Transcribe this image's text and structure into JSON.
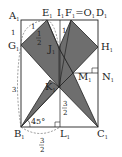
{
  "figure": {
    "type": "geometry",
    "fill_color": "#6e6e6e",
    "stroke_color": "#222222",
    "points": {
      "A": {
        "label": "A",
        "sub": "1"
      },
      "E": {
        "label": "E",
        "sub": "1"
      },
      "I": {
        "label": "I",
        "sub": "1"
      },
      "FO": {
        "label": "F",
        "sub": "1",
        "eq": "=O",
        "sub2": "1"
      },
      "D": {
        "label": "D",
        "sub": "1"
      },
      "G": {
        "label": "G",
        "sub": "1"
      },
      "H": {
        "label": "H",
        "sub": "1"
      },
      "J": {
        "label": "J",
        "sub": "1"
      },
      "M": {
        "label": "M",
        "sub": "1"
      },
      "N": {
        "label": "N",
        "sub": "1"
      },
      "K": {
        "label": "K",
        "sub": "1"
      },
      "B": {
        "label": "B",
        "sub": "1"
      },
      "L": {
        "label": "L",
        "sub": "1"
      },
      "C": {
        "label": "C",
        "sub": "1"
      }
    },
    "measures": {
      "AE": "1",
      "AG": "1",
      "EJ_num": "1",
      "EJ_den": "2",
      "IJ": "1",
      "GB": "3",
      "KL_num": "3",
      "KL_den": "2",
      "BL_num": "3",
      "BL_den": "2",
      "angle_B": "45°"
    }
  }
}
